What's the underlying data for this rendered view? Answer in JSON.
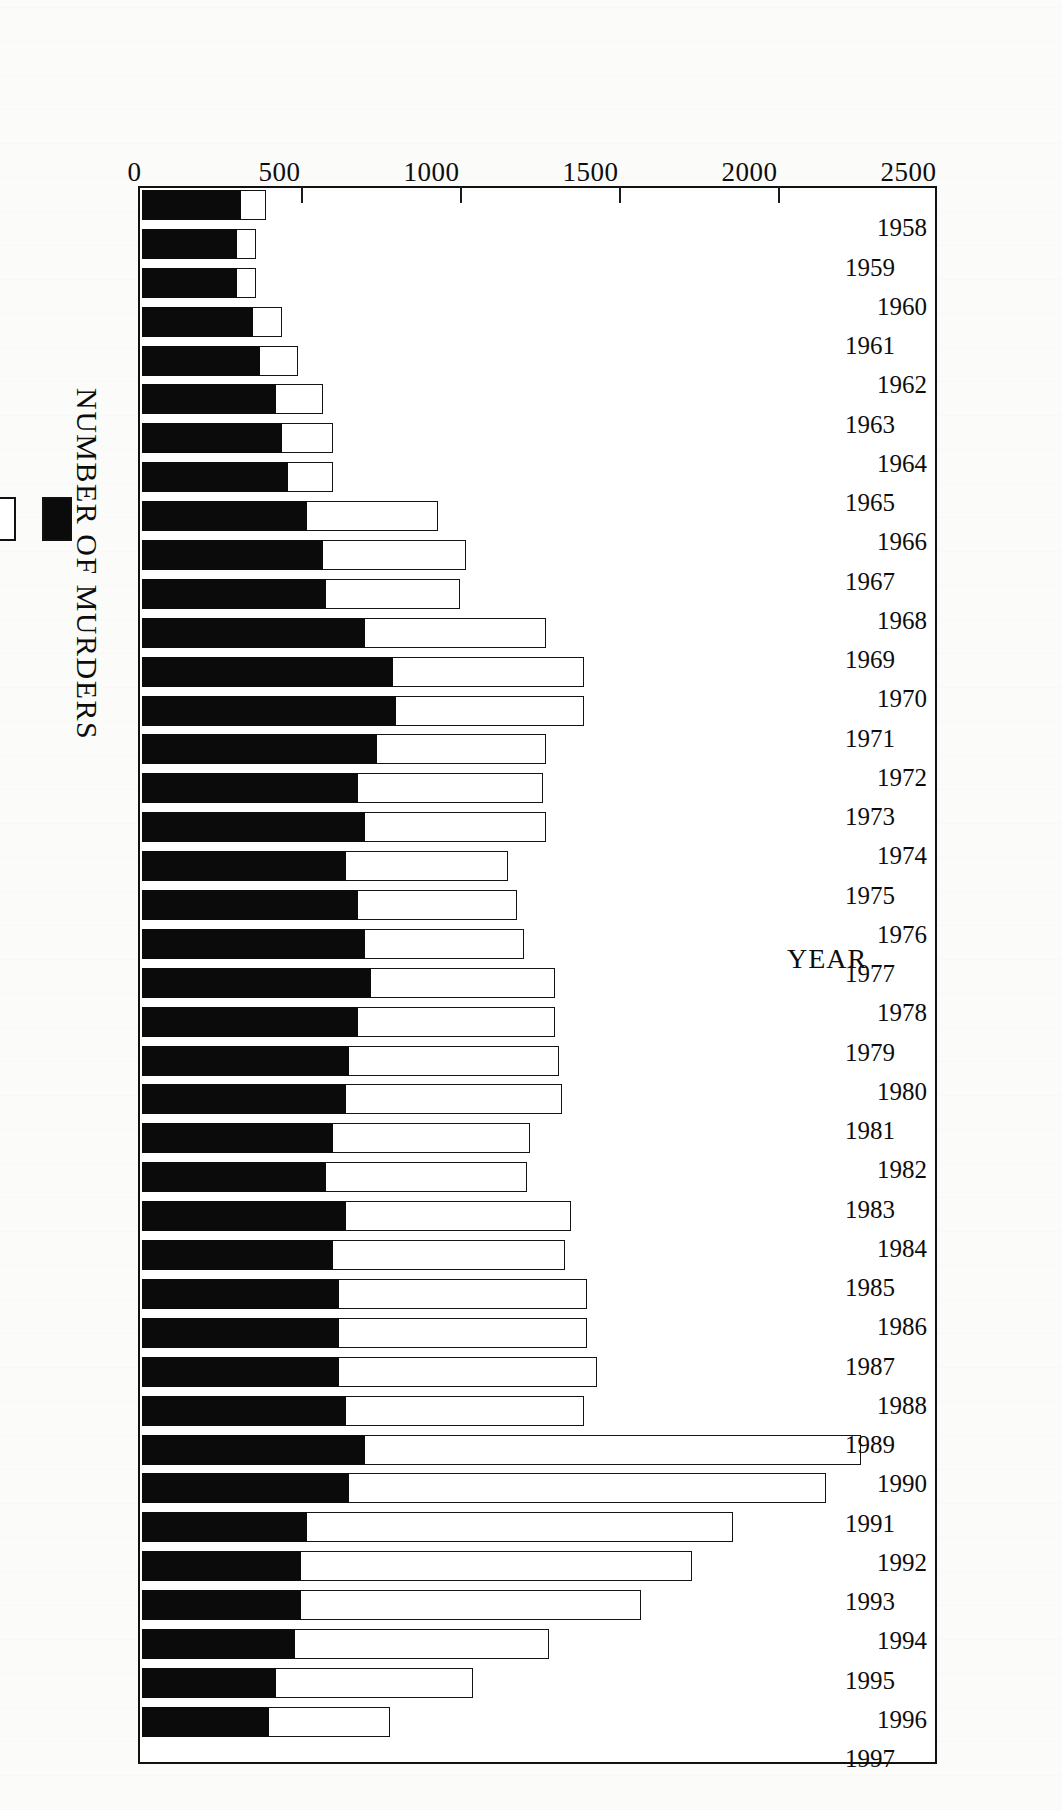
{
  "figure": {
    "title": "NEW YORK CITY, 1958 - 1997",
    "y_axis_title": "NUMBER OF MURDERS",
    "x_axis_title": "YEAR"
  },
  "legend": {
    "items": [
      {
        "label": "",
        "swatch": "black-swatch"
      },
      {
        "label": "",
        "swatch": "white-swatch"
      }
    ]
  },
  "chart_data": {
    "type": "bar",
    "subtype": "stacked-vertical",
    "title": "NEW YORK CITY, 1958 - 1997",
    "xlabel": "YEAR",
    "ylabel": "NUMBER OF MURDERS",
    "ylim": [
      0,
      2500
    ],
    "yticks": [
      0,
      500,
      1000,
      1500,
      2000,
      2500
    ],
    "ytick_labels": [
      "0",
      "500",
      "1000",
      "1500",
      "2000",
      "2500"
    ],
    "grid": false,
    "legend_position": "below-axis-left",
    "categories": [
      "1958",
      "1959",
      "1960",
      "1961",
      "1962",
      "1963",
      "1964",
      "1965",
      "1966",
      "1967",
      "1968",
      "1969",
      "1970",
      "1971",
      "1972",
      "1973",
      "1974",
      "1975",
      "1976",
      "1977",
      "1978",
      "1979",
      "1980",
      "1981",
      "1982",
      "1983",
      "1984",
      "1985",
      "1986",
      "1987",
      "1988",
      "1989",
      "1990",
      "1991",
      "1992",
      "1993",
      "1994",
      "1995",
      "1996",
      "1997"
    ],
    "series": [
      {
        "name": "black-segment",
        "color": "#0b0b0b",
        "values": [
          310,
          300,
          300,
          350,
          370,
          420,
          440,
          460,
          520,
          570,
          580,
          700,
          790,
          800,
          740,
          680,
          700,
          640,
          680,
          700,
          720,
          680,
          650,
          640,
          600,
          580,
          640,
          600,
          620,
          620,
          620,
          640,
          700,
          650,
          520,
          500,
          500,
          480,
          420,
          400
        ]
      },
      {
        "name": "white-segment",
        "color": "#ffffff",
        "values": [
          80,
          60,
          60,
          90,
          120,
          150,
          160,
          140,
          410,
          450,
          420,
          570,
          600,
          590,
          530,
          580,
          570,
          510,
          500,
          500,
          580,
          620,
          660,
          680,
          620,
          630,
          710,
          730,
          780,
          780,
          810,
          750,
          1560,
          1500,
          1340,
          1230,
          1070,
          800,
          620,
          380
        ]
      }
    ],
    "totals": [
      390,
      360,
      360,
      440,
      490,
      570,
      600,
      600,
      930,
      1020,
      1000,
      1270,
      1390,
      1390,
      1270,
      1260,
      1270,
      1150,
      1180,
      1200,
      1300,
      1300,
      1310,
      1320,
      1220,
      1210,
      1350,
      1330,
      1400,
      1400,
      1430,
      1390,
      2260,
      2150,
      1860,
      1730,
      1570,
      1280,
      1040,
      780
    ]
  }
}
